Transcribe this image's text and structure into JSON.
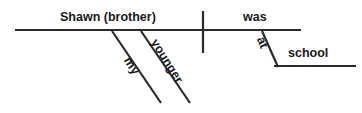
{
  "diagram": {
    "type": "reed-kellogg-sentence-diagram",
    "sentence": "My younger brother Shawn was at school.",
    "ink_color": "#2b2b2b",
    "background_color": "#ffffff",
    "labels": {
      "subject": "Shawn (brother)",
      "verb": "was",
      "object_of_preposition": "school",
      "modifier_possessive": "my",
      "modifier_adjective": "younger",
      "preposition": "at"
    },
    "lines": {
      "baseline": "main horizontal base line",
      "subject_verb_divider": "vertical line crossing baseline",
      "prepositional_phrase_line": "horizontal line under school",
      "slant_my": "diagonal under Shawn (brother)",
      "slant_younger": "diagonal under Shawn (brother)",
      "slant_at": "diagonal under was"
    }
  }
}
